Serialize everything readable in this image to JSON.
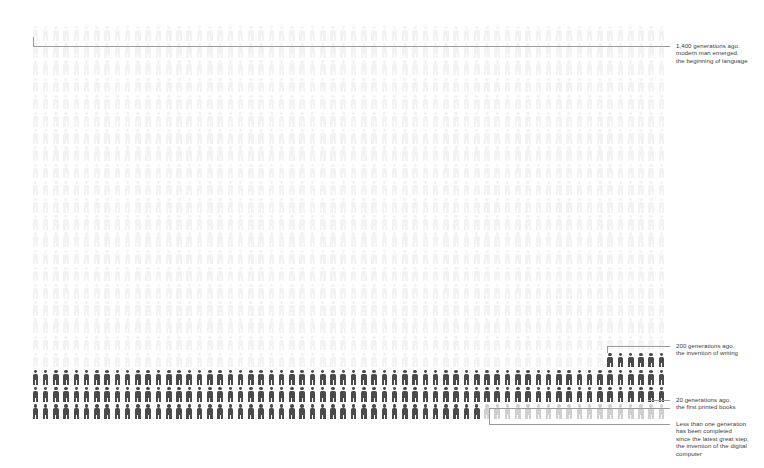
{
  "chart_data": {
    "type": "bar",
    "title": "",
    "subtitle": "",
    "xlabel": "",
    "ylabel": "",
    "legend": [],
    "grid": false,
    "unit": "1 figure = 1 generation",
    "total_figures": 1400,
    "figures_per_row": 62,
    "rows": 23,
    "categories": [
      "prehistory (language)",
      "since writing",
      "since printing",
      "since the digital computer"
    ],
    "values": [
      1200,
      200,
      20,
      0.5
    ],
    "tones": [
      "#f3f3f3",
      "#4a4a4a",
      "#4a4a4a",
      "#cfcfcf"
    ],
    "annotations": [
      {
        "generations": 1400,
        "marker_row": 0,
        "lines": [
          "1,400 generations ago.",
          "modern man emerged.",
          "the beginning of language"
        ]
      },
      {
        "generations": 200,
        "marker_row": 19,
        "lines": [
          "200 generations ago.",
          "the invention of writing"
        ]
      },
      {
        "generations": 20,
        "marker_row": 22,
        "lines": [
          "20 generations ago.",
          "the first printed books"
        ]
      },
      {
        "generations": 0.5,
        "marker_row": 22,
        "lines": [
          "Less than one generation",
          "has been completed",
          "since the latest great step,",
          "the invention of the digital",
          "computer"
        ]
      }
    ]
  },
  "colors": {
    "background": "#ffffff",
    "figure_faint": "#f3f3f3",
    "figure_mid": "#cfcfcf",
    "figure_dark": "#4a4a4a",
    "leader_line": "#9a9a9a",
    "text": "#3c3c3c"
  },
  "annotations": {
    "language": {
      "line1": "1,400 generations ago.",
      "line2": "modern man emerged.",
      "line3": "the beginning of language"
    },
    "writing": {
      "line1": "200 generations ago.",
      "line2": "the invention of writing"
    },
    "printing": {
      "line1": "20 generations ago.",
      "line2": "the first printed books"
    },
    "computer": {
      "line1": "Less than one generation",
      "line2": "has been completed",
      "line3": "since the latest great step,",
      "line4": "the invention of the digital",
      "line5": "computer"
    }
  }
}
